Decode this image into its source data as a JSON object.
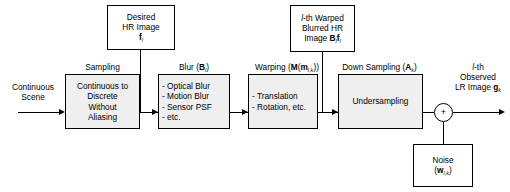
{
  "diagram": {
    "input": {
      "label_line1": "Continuous",
      "label_line2": "Scene"
    },
    "top_boxes": [
      {
        "name": "desired-hr-image",
        "line1": "Desired",
        "line2": "HR Image",
        "line3_symbol": "f",
        "line3_subscript": "l"
      },
      {
        "name": "warped-blurred-hr-image",
        "line1_italic": "l",
        "line1_rest": "-th Warped",
        "line2": "Blurred HR",
        "line3_prefix": "Image ",
        "line3_symbol1": "B",
        "line3_subscript1": "l",
        "line3_symbol2": "f",
        "line3_subscript2": "l"
      }
    ],
    "stages": [
      {
        "name": "sampling",
        "caption": "Sampling",
        "caption_operator": "",
        "lines": [
          "Continuous to",
          "Discrete",
          "Without",
          "Aliasing"
        ],
        "align": "center"
      },
      {
        "name": "blur",
        "caption": "Blur (",
        "caption_operator": "B",
        "caption_subscript": "l",
        "caption_close": ")",
        "lines": [
          "- Optical Blur",
          "- Motion Blur",
          "- Sensor PSF",
          "- etc."
        ],
        "align": "left"
      },
      {
        "name": "warping",
        "caption": "Warping (",
        "caption_operator": "M",
        "caption_inner_open": "(",
        "caption_inner_operator": "m",
        "caption_subscript": "l,k",
        "caption_inner_close": ")",
        "caption_close": ")",
        "lines": [
          "- Translation",
          "- Rotation, etc."
        ],
        "align": "left"
      },
      {
        "name": "down-sampling",
        "caption": "Down Sampling (",
        "caption_operator": "A",
        "caption_subscript": "k",
        "caption_close": ")",
        "lines": [
          "Undersampling"
        ],
        "align": "center"
      }
    ],
    "noise_box": {
      "name": "noise",
      "line1": "Noise",
      "line2_open": "(",
      "line2_symbol": "w",
      "line2_subscript": "l,k",
      "line2_close": ")"
    },
    "sum_node": {
      "symbol": "+"
    },
    "output": {
      "line1_italic": "l",
      "line1_rest": "-th",
      "line2": "Observed",
      "line3_prefix": "LR  Image ",
      "line3_symbol": "g",
      "line3_subscript": "k"
    },
    "colors": {
      "stroke": "#000000",
      "box_fill": "#efefef",
      "page_bg": "#ffffff"
    }
  }
}
